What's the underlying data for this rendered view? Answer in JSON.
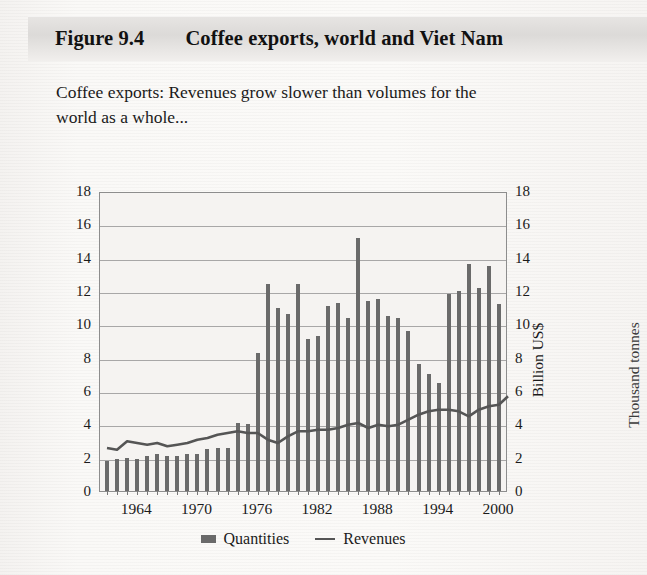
{
  "banner": {
    "figure_number": "Figure 9.4",
    "figure_title": "Coffee exports, world and Viet Nam"
  },
  "subtitle": "Coffee exports: Revenues grow slower than volumes for the world as a whole...",
  "legend": {
    "quantities_label": "Quantities",
    "revenues_label": "Revenues"
  },
  "axis": {
    "left_title": "Million tonnes",
    "right_title": "Billion US$",
    "far_right_title": "Thousand tonnes"
  },
  "colors": {
    "bar": "#6a6a6a",
    "line": "#555555",
    "grid": "#8d8d8d",
    "plot_bg": "#f5f3f1",
    "banner_bg": "#dcdad8"
  },
  "chart_data": {
    "type": "bar",
    "title": "Coffee exports: Revenues grow slower than volumes for the world as a whole...",
    "xlabel": "",
    "ylabel": "Million tonnes",
    "y2label": "Billion US$",
    "ylim": [
      0,
      18
    ],
    "y2lim": [
      0,
      18
    ],
    "yticks": [
      0,
      2,
      4,
      6,
      8,
      10,
      12,
      14,
      16,
      18
    ],
    "y2ticks": [
      0,
      2,
      4,
      6,
      8,
      10,
      12,
      14,
      16,
      18
    ],
    "grid": true,
    "legend_position": "bottom-center",
    "x": [
      1961,
      1962,
      1963,
      1964,
      1965,
      1966,
      1967,
      1968,
      1969,
      1970,
      1971,
      1972,
      1973,
      1974,
      1975,
      1976,
      1977,
      1978,
      1979,
      1980,
      1981,
      1982,
      1983,
      1984,
      1985,
      1986,
      1987,
      1988,
      1989,
      1990,
      1991,
      1992,
      1993,
      1994,
      1995,
      1996,
      1997,
      1998,
      1999,
      2000
    ],
    "xtick_labels": [
      "1964",
      "1970",
      "1976",
      "1982",
      "1988",
      "1994",
      "2000"
    ],
    "xtick_values": [
      1964,
      1970,
      1976,
      1982,
      1988,
      1994,
      2000
    ],
    "series": [
      {
        "name": "Quantities",
        "type": "bar",
        "axis": "left",
        "unit": "Million tonnes",
        "values": [
          1.8,
          1.9,
          2.0,
          1.9,
          2.1,
          2.2,
          2.1,
          2.1,
          2.2,
          2.2,
          2.5,
          2.6,
          2.6,
          4.1,
          4.0,
          8.3,
          12.4,
          11.0,
          10.6,
          12.4,
          9.1,
          9.3,
          11.1,
          11.3,
          10.4,
          15.2,
          11.4,
          11.5,
          10.5,
          10.4,
          9.6,
          7.6,
          7.0,
          6.5,
          11.8,
          12.0,
          13.6,
          12.2,
          13.5,
          11.2
        ]
      },
      {
        "name": "Revenues",
        "type": "line",
        "axis": "right",
        "unit": "Billion US$",
        "values": [
          2.7,
          2.6,
          3.1,
          3.0,
          2.9,
          3.0,
          2.8,
          2.9,
          3.0,
          3.2,
          3.3,
          3.5,
          3.6,
          3.7,
          3.6,
          3.6,
          3.2,
          3.0,
          3.4,
          3.7,
          3.7,
          3.8,
          3.8,
          3.9,
          4.1,
          4.2,
          3.9,
          4.1,
          4.0,
          4.1,
          4.4,
          4.7,
          4.9,
          5.0,
          5.0,
          4.9,
          4.6,
          5.0,
          5.2,
          5.3
        ]
      }
    ],
    "final_revenue_value": 5.8,
    "peak_quantity": {
      "year": 1986,
      "value": 15.2
    }
  }
}
